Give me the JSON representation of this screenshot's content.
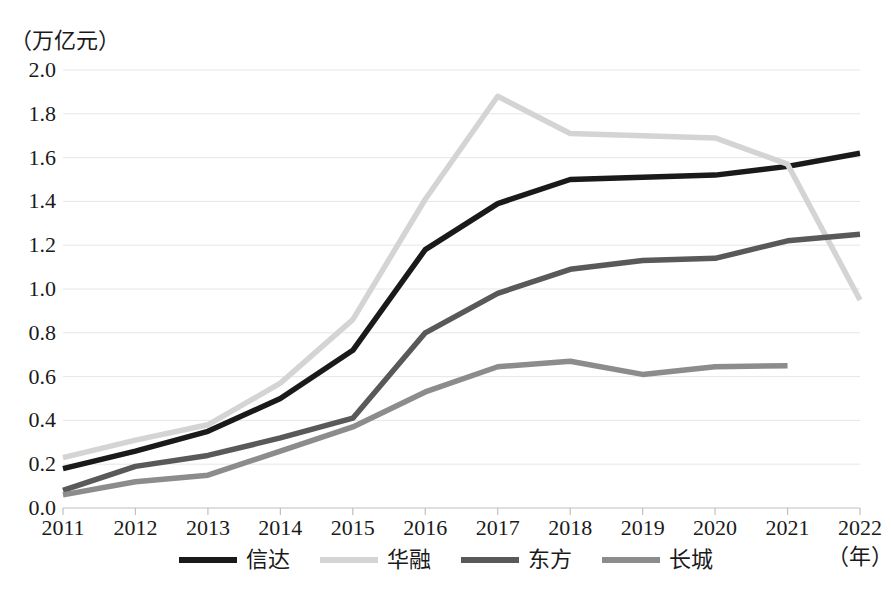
{
  "chart_data": {
    "type": "line",
    "title": "",
    "subtitle": "",
    "xlabel": "（年）",
    "ylabel": "（万亿元）",
    "unit_caption": "（万亿元）",
    "year_caption": "（年）",
    "grid": true,
    "legend_position": "bottom",
    "xlim": [
      2011,
      2022
    ],
    "ylim": [
      0.0,
      2.0
    ],
    "ytick_step": 0.2,
    "categories": [
      2011,
      2012,
      2013,
      2014,
      2015,
      2016,
      2017,
      2018,
      2019,
      2020,
      2021,
      2022
    ],
    "xtick_labels": [
      "2011",
      "2012",
      "2013",
      "2014",
      "2015",
      "2016",
      "2017",
      "2018",
      "2019",
      "2020",
      "2021",
      "2022"
    ],
    "ytick_labels": [
      "2.0",
      "1.8",
      "1.6",
      "1.4",
      "1.2",
      "1.0",
      "0.8",
      "0.6",
      "0.4",
      "0.2",
      "0.0"
    ],
    "ytick_values": [
      2.0,
      1.8,
      1.6,
      1.4,
      1.2,
      1.0,
      0.8,
      0.6,
      0.4,
      0.2,
      0.0
    ],
    "series": [
      {
        "name": "信达",
        "color": "#1a1a1a",
        "values": [
          0.18,
          0.26,
          0.35,
          0.5,
          0.72,
          1.18,
          1.39,
          1.5,
          1.51,
          1.52,
          1.56,
          1.62
        ]
      },
      {
        "name": "华融",
        "color": "#d4d4d4",
        "values": [
          0.23,
          0.31,
          0.38,
          0.57,
          0.86,
          1.41,
          1.88,
          1.71,
          1.7,
          1.69,
          1.57,
          0.95
        ]
      },
      {
        "name": "东方",
        "color": "#595959",
        "values": [
          0.08,
          0.19,
          0.24,
          0.32,
          0.41,
          0.8,
          0.98,
          1.09,
          1.13,
          1.14,
          1.22,
          1.25
        ]
      },
      {
        "name": "长城",
        "color": "#8c8c8c",
        "values": [
          0.06,
          0.12,
          0.15,
          0.26,
          0.37,
          0.53,
          0.645,
          0.67,
          0.61,
          0.645,
          0.65,
          null
        ]
      }
    ]
  },
  "legend": {
    "items": [
      {
        "label": "信达",
        "color": "#1a1a1a"
      },
      {
        "label": "华融",
        "color": "#d4d4d4"
      },
      {
        "label": "东方",
        "color": "#595959"
      },
      {
        "label": "长城",
        "color": "#8c8c8c"
      }
    ]
  },
  "colors": {
    "background": "#ffffff",
    "grid": "#e6e6e6",
    "axis": "#bfbfbf",
    "text": "#1a1a1a"
  }
}
